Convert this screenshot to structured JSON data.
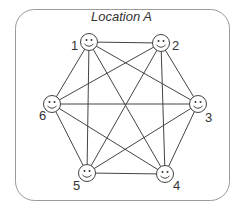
{
  "title": "Location A",
  "colors": {
    "line": "#444444",
    "frame": "#9a9a9a"
  },
  "nodes": [
    {
      "id": "1",
      "label": "1",
      "icon": "smiley-face-icon"
    },
    {
      "id": "2",
      "label": "2",
      "icon": "smiley-face-icon"
    },
    {
      "id": "3",
      "label": "3",
      "icon": "smiley-face-icon"
    },
    {
      "id": "4",
      "label": "4",
      "icon": "smiley-face-icon"
    },
    {
      "id": "5",
      "label": "5",
      "icon": "smiley-face-icon"
    },
    {
      "id": "6",
      "label": "6",
      "icon": "smiley-face-icon"
    }
  ],
  "edges": "complete graph: every node connected to every other node (15 edges)"
}
